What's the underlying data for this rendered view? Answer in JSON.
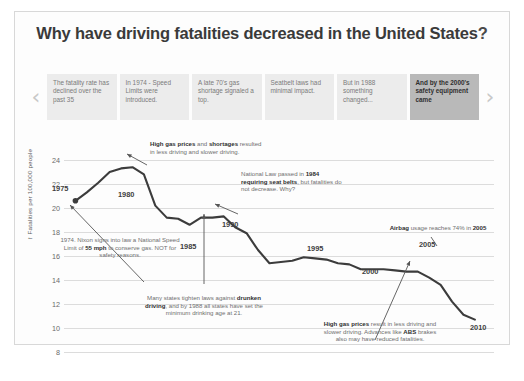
{
  "header": {
    "title_main": "Why have driving fatalities decreased in the United States",
    "title_q": "?"
  },
  "nav": {
    "prev_icon": "chevron-left-icon",
    "next_icon": "chevron-right-icon",
    "cards": [
      {
        "text": "The fatality rate has declined over the past 35",
        "active": false
      },
      {
        "text": "In 1974 - Speed Limits were introduced.",
        "active": false
      },
      {
        "text": "A late 70's gas shortage signaled a top.",
        "active": false
      },
      {
        "text": "Seatbelt laws had minimal impact.",
        "active": false
      },
      {
        "text": "But in 1988 something changed...",
        "active": false
      },
      {
        "text": "And by the 2000's safety equipment came",
        "active": true
      }
    ]
  },
  "chart_data": {
    "type": "line",
    "title": "Why have driving fatalities decreased in the United States?",
    "xlabel": "",
    "ylabel": "Fatalities per 100,000 people",
    "ylim": [
      7,
      25
    ],
    "yticks": [
      24,
      22,
      20,
      18,
      16,
      14,
      12,
      10,
      8
    ],
    "grid": true,
    "legend": "none",
    "line_color": "#3c3c3c",
    "x": [
      1975,
      1976,
      1977,
      1978,
      1979,
      1980,
      1981,
      1982,
      1983,
      1984,
      1985,
      1986,
      1987,
      1988,
      1989,
      1990,
      1991,
      1992,
      1993,
      1994,
      1995,
      1996,
      1997,
      1998,
      1999,
      2000,
      2001,
      2002,
      2003,
      2004,
      2005,
      2006,
      2007,
      2008,
      2009,
      2010
    ],
    "values": [
      20.6,
      21.3,
      22.1,
      23.0,
      23.3,
      23.4,
      22.8,
      20.2,
      19.2,
      19.1,
      18.6,
      19.2,
      19.2,
      19.3,
      18.4,
      17.9,
      16.5,
      15.4,
      15.5,
      15.6,
      15.9,
      15.8,
      15.7,
      15.4,
      15.3,
      14.9,
      14.9,
      14.9,
      14.8,
      14.7,
      14.7,
      14.2,
      13.6,
      12.2,
      11.1,
      10.7
    ],
    "markers": [
      1975
    ],
    "year_labels": [
      {
        "year": 1975,
        "label": "1975"
      },
      {
        "year": 1980,
        "label": "1980"
      },
      {
        "year": 1985,
        "label": "1985"
      },
      {
        "year": 1990,
        "label": "1990"
      },
      {
        "year": 1995,
        "label": "1995"
      },
      {
        "year": 2000,
        "label": "2000"
      },
      {
        "year": 2005,
        "label": "2005"
      },
      {
        "year": 2010,
        "label": "2010"
      }
    ],
    "annotations": [
      {
        "name": "gas-prices-1979",
        "html": "<b>High gas prices</b> and <b>shortages</b> resulted in less driving and slower driving."
      },
      {
        "name": "seat-belt-law-1984",
        "html": "National Law passed in <b>1984 requiring seat belts</b>, but fatalities do not decrease.  Why?"
      },
      {
        "name": "nixon-speed-limit-1974",
        "html": "1974. Nixon signs into law a National Speed Limit of <b>55 mph</b> to conserve gas.  NOT for safety reasons."
      },
      {
        "name": "drunken-driving-laws-1988",
        "html": "Many states tighten laws against <b>drunken driving</b>, and by 1988 all states have set the minimum drinking age at 21."
      },
      {
        "name": "airbag-usage-2005",
        "html": "<b>Airbag</b> usage reaches 74% in <b>2005</b>"
      },
      {
        "name": "gas-prices-abs-2008",
        "html": "<b>High gas prices</b> result in less driving and slower driving. Advances like <b>ABS</b> brakes also may have reduced fatalities."
      }
    ]
  },
  "caption": ""
}
